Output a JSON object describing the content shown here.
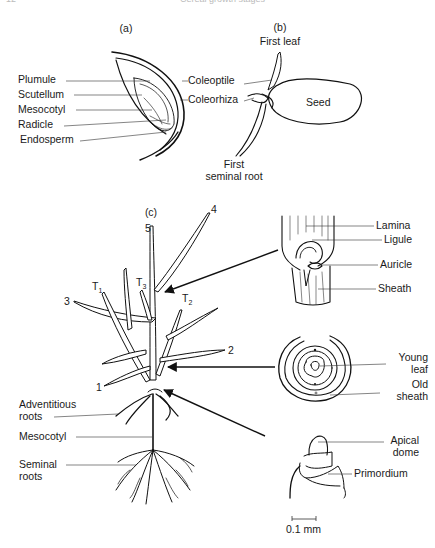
{
  "page_header": {
    "page_number": "12",
    "running_title": "Cereal growth stages"
  },
  "panels": {
    "a": {
      "label": "(a)",
      "left_labels": [
        "Plumule",
        "Scutellum",
        "Mesocotyl",
        "Radicle",
        "Endosperm"
      ],
      "right_labels": [
        "Coleoptile",
        "Coleorhiza"
      ]
    },
    "b": {
      "label": "(b)",
      "labels": {
        "first_leaf": "First leaf",
        "seed": "Seed",
        "first_seminal_root_line1": "First",
        "first_seminal_root_line2": "seminal root"
      }
    },
    "c": {
      "label": "(c)",
      "leaf_numbers": [
        "1",
        "2",
        "3",
        "4",
        "5"
      ],
      "tillers": [
        {
          "base": "T",
          "sub": "1"
        },
        {
          "base": "T",
          "sub": "2"
        },
        {
          "base": "T",
          "sub": "3"
        }
      ],
      "left_labels": {
        "adventitious_line1": "Adventitious",
        "adventitious_line2": "roots",
        "mesocotyl": "Mesocotyl",
        "seminal_line1": "Seminal",
        "seminal_line2": "roots"
      }
    },
    "details": {
      "ligule_detail": [
        "Lamina",
        "Ligule",
        "Auricle",
        "Sheath"
      ],
      "cross_section": {
        "young_leaf_line1": "Young",
        "young_leaf_line2": "leaf",
        "old_sheath_line1": "Old",
        "old_sheath_line2": "sheath"
      },
      "apex": {
        "apical_dome_line1": "Apical",
        "apical_dome_line2": "dome",
        "primordium": "Primordium"
      },
      "scale_bar": "0.1 mm"
    }
  }
}
